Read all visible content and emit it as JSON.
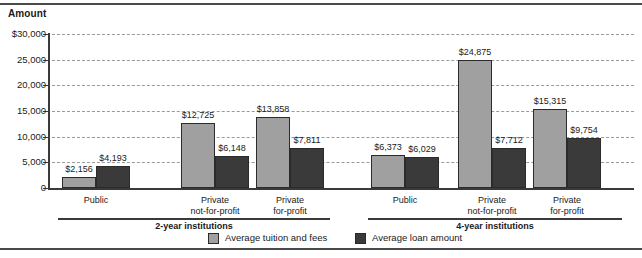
{
  "chart_data": {
    "type": "bar",
    "title": "",
    "ylabel": "Amount",
    "xlabel": "",
    "ylim": [
      0,
      30000
    ],
    "grid": true,
    "legend_position": "bottom-center",
    "y_ticks": [
      "$30,000",
      "25,000",
      "20,000",
      "15,000",
      "10,000",
      "5,000",
      "0"
    ],
    "y_tick_values": [
      30000,
      25000,
      20000,
      15000,
      10000,
      5000,
      0
    ],
    "legend": [
      "Average tuition and fees",
      "Average loan amount"
    ],
    "groups": [
      {
        "name": "2-year institutions",
        "categories": [
          "Public",
          "Private not-for-profit",
          "Private for-profit"
        ]
      },
      {
        "name": "4-year institutions",
        "categories": [
          "Public",
          "Private not-for-profit",
          "Private for-profit"
        ]
      }
    ],
    "categories": [
      "Public",
      "Private not-for-profit",
      "Private for-profit",
      "Public",
      "Private not-for-profit",
      "Private for-profit"
    ],
    "series": [
      {
        "name": "Average tuition and fees",
        "color": "#a0a0a0",
        "values": [
          2156,
          12725,
          13858,
          6373,
          24875,
          15315
        ],
        "labels": [
          "$2,156",
          "$12,725",
          "$13,858",
          "$6,373",
          "$24,875",
          "$15,315"
        ]
      },
      {
        "name": "Average loan amount",
        "color": "#3a3a3a",
        "values": [
          4193,
          6148,
          7811,
          6029,
          7712,
          9754
        ],
        "labels": [
          "$4,193",
          "$6,148",
          "$7,811",
          "$6,029",
          "$7,712",
          "$9,754"
        ]
      }
    ]
  },
  "axis": {
    "amount_label": "Amount"
  },
  "ticks": [
    {
      "label": "$30,000"
    },
    {
      "label": "25,000"
    },
    {
      "label": "20,000"
    },
    {
      "label": "15,000"
    },
    {
      "label": "10,000"
    },
    {
      "label": "5,000"
    },
    {
      "label": "0"
    }
  ],
  "cats": [
    {
      "line1": "Public",
      "line2": ""
    },
    {
      "line1": "Private",
      "line2": "not-for-profit"
    },
    {
      "line1": "Private",
      "line2": "for-profit"
    },
    {
      "line1": "Public",
      "line2": ""
    },
    {
      "line1": "Private",
      "line2": "not-for-profit"
    },
    {
      "line1": "Private",
      "line2": "for-profit"
    }
  ],
  "group_labels": [
    {
      "label": "2-year institutions"
    },
    {
      "label": "4-year institutions"
    }
  ],
  "legend_items": [
    {
      "label": "Average tuition and fees",
      "kind": "tuition"
    },
    {
      "label": "Average loan amount",
      "kind": "loan"
    }
  ]
}
